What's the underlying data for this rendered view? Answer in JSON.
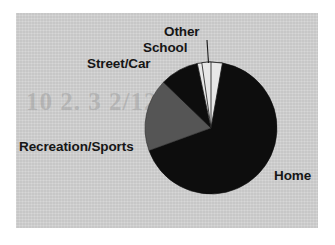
{
  "figure": {
    "background_color": "#cfcfcf",
    "page_color": "#ffffff",
    "ghost_text": "10 2. 3 2/12"
  },
  "labels": {
    "other": "Other",
    "school": "School",
    "street_car": "Street/Car",
    "recreation_sports": "Recreation/Sports",
    "home": "Home"
  },
  "chart_data": {
    "type": "pie",
    "title": "",
    "subtitle": "",
    "xlabel": "",
    "ylabel": "",
    "legend_position": "none",
    "grid": false,
    "labels_outside": true,
    "categories": [
      "Home",
      "Recreation/Sports",
      "Street/Car",
      "School",
      "Other"
    ],
    "values": [
      69.5,
      17.8,
      9.4,
      6.1,
      2.2
    ],
    "units": "percent",
    "start_angle_deg": 0,
    "direction": "clockwise",
    "slices": [
      {
        "label": "Home",
        "value": 69.5,
        "color": "#0d0d0d",
        "start_angle_deg": 0,
        "end_angle_deg": 250,
        "label_anchor": "right",
        "leader_line": false
      },
      {
        "label": "Recreation/Sports",
        "value": 17.8,
        "color": "#555555",
        "start_angle_deg": 250,
        "end_angle_deg": 314,
        "label_anchor": "left",
        "leader_line": false
      },
      {
        "label": "Street/Car",
        "value": 9.4,
        "color": "#0d0d0d",
        "start_angle_deg": 314,
        "end_angle_deg": 348,
        "label_anchor": "upper-left",
        "leader_line": false
      },
      {
        "label": "School",
        "value": 6.1,
        "color": "#e8e8e8",
        "start_angle_deg": 348,
        "end_angle_deg": 370,
        "label_anchor": "top",
        "leader_line": false
      },
      {
        "label": "Other",
        "value": 2.2,
        "color": "#e8e8e8",
        "start_angle_deg": 352,
        "end_angle_deg": 360,
        "label_anchor": "top",
        "leader_line": true
      }
    ],
    "geometry": {
      "center_x": 211,
      "center_y": 128,
      "radius": 66
    }
  }
}
